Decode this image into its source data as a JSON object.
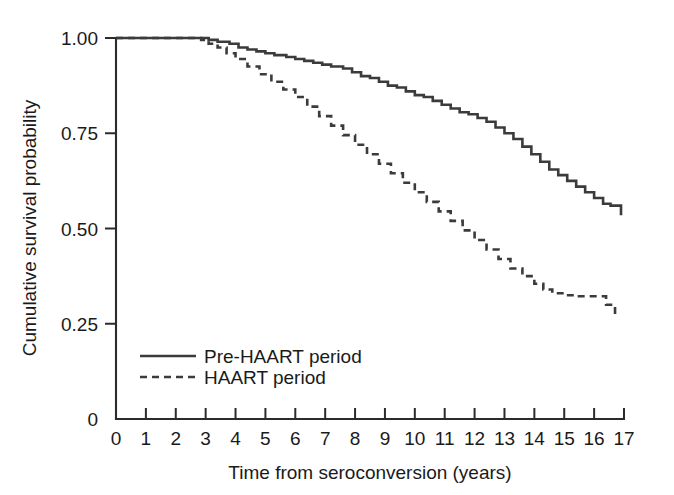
{
  "chart_data": {
    "type": "line",
    "title": "",
    "subtitle": "",
    "xlabel": "Time from seroconversion (years)",
    "ylabel": "Cumulative survival probability",
    "xlim": [
      0,
      17
    ],
    "ylim": [
      0,
      1.0
    ],
    "grid": false,
    "legend_position": "inside-lower-left",
    "xticks": [
      0,
      1,
      2,
      3,
      4,
      5,
      6,
      7,
      8,
      9,
      10,
      11,
      12,
      13,
      14,
      15,
      16,
      17
    ],
    "xtick_labels": [
      "0",
      "1",
      "2",
      "3",
      "4",
      "5",
      "6",
      "7",
      "8",
      "9",
      "10",
      "11",
      "12",
      "13",
      "14",
      "15",
      "16",
      "17"
    ],
    "yticks": [
      0,
      0.25,
      0.5,
      0.75,
      1.0
    ],
    "ytick_labels": [
      "0",
      "0.25",
      "0.50",
      "0.75",
      "1.00"
    ],
    "series": [
      {
        "name": "Pre-HAART period",
        "style": "solid",
        "color": "#3b3b3b",
        "x": [
          0,
          0.6,
          0.9,
          1.3,
          1.6,
          2.0,
          2.3,
          2.6,
          2.9,
          3.1,
          3.4,
          3.8,
          4.1,
          4.4,
          4.7,
          5.0,
          5.3,
          5.7,
          6.0,
          6.3,
          6.6,
          6.9,
          7.2,
          7.6,
          7.9,
          8.2,
          8.5,
          8.8,
          9.1,
          9.4,
          9.7,
          10.0,
          10.3,
          10.6,
          10.9,
          11.2,
          11.5,
          11.8,
          12.1,
          12.4,
          12.7,
          13.0,
          13.3,
          13.6,
          13.9,
          14.2,
          14.5,
          14.8,
          15.1,
          15.4,
          15.7,
          16.0,
          16.3,
          16.55,
          16.55,
          16.9
        ],
        "y": [
          1.0,
          1.0,
          1.0,
          1.0,
          1.0,
          1.0,
          1.0,
          1.0,
          1.0,
          0.995,
          0.99,
          0.985,
          0.975,
          0.97,
          0.965,
          0.96,
          0.955,
          0.95,
          0.945,
          0.94,
          0.935,
          0.93,
          0.925,
          0.92,
          0.91,
          0.9,
          0.895,
          0.885,
          0.875,
          0.87,
          0.86,
          0.85,
          0.845,
          0.835,
          0.825,
          0.815,
          0.805,
          0.8,
          0.79,
          0.78,
          0.765,
          0.75,
          0.735,
          0.715,
          0.695,
          0.675,
          0.655,
          0.64,
          0.625,
          0.61,
          0.595,
          0.58,
          0.565,
          0.56,
          0.56,
          0.535
        ]
      },
      {
        "name": "HAART period",
        "style": "dashed",
        "color": "#3b3b3b",
        "x": [
          0,
          0.6,
          1.0,
          1.4,
          1.8,
          2.2,
          2.6,
          2.85,
          3.1,
          3.4,
          3.7,
          4.0,
          4.4,
          4.8,
          5.2,
          5.6,
          6.0,
          6.4,
          6.8,
          7.2,
          7.6,
          8.0,
          8.4,
          8.8,
          9.2,
          9.6,
          10.0,
          10.4,
          10.8,
          11.2,
          11.6,
          12.0,
          12.4,
          12.8,
          13.2,
          13.6,
          14.0,
          14.3,
          14.6,
          15.0,
          15.4,
          15.8,
          16.1,
          16.4,
          16.7
        ],
        "y": [
          1.0,
          1.0,
          1.0,
          1.0,
          1.0,
          1.0,
          1.0,
          0.995,
          0.985,
          0.975,
          0.96,
          0.945,
          0.925,
          0.905,
          0.885,
          0.865,
          0.845,
          0.82,
          0.795,
          0.77,
          0.745,
          0.72,
          0.695,
          0.67,
          0.645,
          0.62,
          0.595,
          0.57,
          0.545,
          0.52,
          0.495,
          0.47,
          0.445,
          0.42,
          0.395,
          0.375,
          0.355,
          0.34,
          0.33,
          0.325,
          0.322,
          0.322,
          0.322,
          0.3,
          0.272
        ]
      }
    ]
  },
  "legend": {
    "items": [
      {
        "label": "Pre-HAART period",
        "style": "solid"
      },
      {
        "label": "HAART period",
        "style": "dashed"
      }
    ]
  }
}
